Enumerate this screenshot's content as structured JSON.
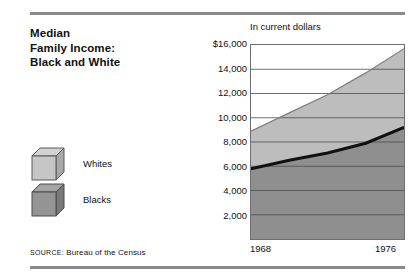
{
  "title_lines": [
    "Median",
    "Family Income:",
    "Black and White"
  ],
  "legend": [
    {
      "label": "Whites",
      "icon": "cube-icon",
      "color": "#bdbdbd"
    },
    {
      "label": "Blacks",
      "icon": "cube-icon",
      "color": "#8f8f8f"
    }
  ],
  "source": {
    "prefix": "SOURCE:",
    "text": "Bureau of the Census"
  },
  "chart_data": {
    "type": "area",
    "title": "Median Family Income: Black and White",
    "subtitle": "In current dollars",
    "xlabel": "",
    "ylabel": "In current dollars",
    "x": [
      1968,
      1976
    ],
    "xtick_labels": [
      "1968",
      "1976"
    ],
    "xlim": [
      1968,
      1976
    ],
    "ylim": [
      0,
      16000
    ],
    "ytick_labels": [
      "$16,000",
      "14,000",
      "12,000",
      "10,000",
      "8,000",
      "6,000",
      "4,000",
      "2,000"
    ],
    "ytick_values": [
      16000,
      14000,
      12000,
      10000,
      8000,
      6000,
      4000,
      2000
    ],
    "grid": true,
    "legend_position": "left-panel",
    "series": [
      {
        "name": "Whites",
        "color": "#bdbdbd",
        "x": [
          1968,
          1970,
          1972,
          1974,
          1976
        ],
        "values": [
          8900,
          10400,
          11900,
          13700,
          15700
        ]
      },
      {
        "name": "Blacks",
        "color": "#8f8f8f",
        "x": [
          1968,
          1970,
          1972,
          1974,
          1976
        ],
        "values": [
          5800,
          6500,
          7100,
          7900,
          9200
        ]
      }
    ]
  }
}
